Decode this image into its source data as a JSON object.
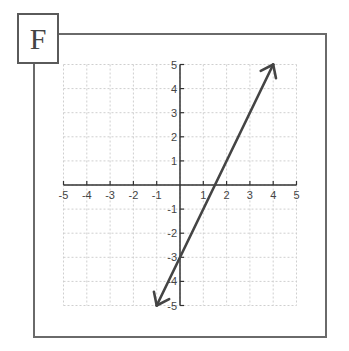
{
  "panel": {
    "label": "F"
  },
  "chart_data": {
    "type": "line",
    "title": "",
    "xlabel": "",
    "ylabel": "",
    "xlim": [
      -5,
      5
    ],
    "ylim": [
      -5,
      5
    ],
    "grid": true,
    "x_ticks": [
      "-5",
      "-4",
      "-3",
      "-2",
      "-1",
      "1",
      "2",
      "3",
      "4",
      "5"
    ],
    "y_ticks": [
      "5",
      "4",
      "3",
      "2",
      "1",
      "-1",
      "-2",
      "-3",
      "-4",
      "-5"
    ],
    "series": [
      {
        "name": "y = 2x - 3",
        "x": [
          -1,
          0,
          1.5,
          4
        ],
        "y": [
          -5,
          -3,
          0,
          5
        ],
        "arrows": "both",
        "color": "#444444"
      }
    ],
    "annotations": []
  },
  "colors": {
    "grid": "#cfcfcf",
    "axis": "#333333",
    "line": "#444444",
    "frame": "#6a6a6a"
  }
}
